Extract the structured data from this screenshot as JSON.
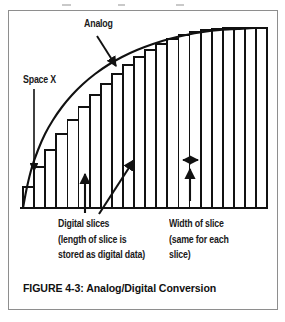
{
  "figure": {
    "caption": "FIGURE 4-3: Analog/Digital Conversion",
    "labels": {
      "analog": "Analog",
      "space_x": "Space X",
      "digital_slices": {
        "line1": "Digital slices",
        "line2": "(length of slice is",
        "line3": "stored as digital data)"
      },
      "width_of_slice": {
        "line1": "Width of slice",
        "line2": "(same for each",
        "line3": "slice)"
      }
    },
    "colors": {
      "ink": "#111111",
      "frame": "#8e8e8e",
      "paper": "#ffffff"
    }
  },
  "chart_data": {
    "type": "area",
    "title": "FIGURE 4-3: Analog/Digital Conversion",
    "xlabel": "",
    "ylabel": "",
    "grid": false,
    "legend": "none",
    "xlim": [
      0,
      270
    ],
    "ylim": [
      0,
      200
    ],
    "series": [
      {
        "name": "Analog",
        "type": "line",
        "note": "smooth concave-down analog waveform rising from the baseline and flattening at the right",
        "points": [
          [
            22,
            207
          ],
          [
            26,
            186
          ],
          [
            31,
            166
          ],
          [
            37,
            149
          ],
          [
            44,
            133
          ],
          [
            52,
            119
          ],
          [
            61,
            106
          ],
          [
            71,
            94
          ],
          [
            82,
            83
          ],
          [
            94,
            73
          ],
          [
            107,
            64
          ],
          [
            121,
            56
          ],
          [
            136,
            49
          ],
          [
            152,
            43
          ],
          [
            168,
            38
          ],
          [
            185,
            34
          ],
          [
            202,
            31
          ],
          [
            219,
            29
          ],
          [
            236,
            28
          ],
          [
            253,
            27
          ],
          [
            266,
            27
          ]
        ]
      },
      {
        "name": "Digital slices",
        "type": "bar",
        "note": "22 equal-width vertical slices; each slice top is flat and meets the analog curve at the slice right edge",
        "baseline_y": 207,
        "slice_count": 22,
        "slice_left_x": 22,
        "slice_width": 11.1,
        "top_y": [
          186,
          166,
          149,
          133,
          119,
          106,
          94,
          83,
          73,
          64,
          56,
          49,
          43,
          38,
          34,
          31,
          29,
          28,
          27,
          27,
          27,
          27
        ]
      }
    ],
    "annotations": [
      {
        "name": "analog-pointer",
        "text": "Analog",
        "from": [
          96,
          33
        ],
        "to": [
          115,
          64
        ],
        "arrow": "end"
      },
      {
        "name": "space-x-pointer",
        "text": "Space X",
        "from": [
          33,
          86
        ],
        "to": [
          33,
          172
        ],
        "arrow": "end"
      },
      {
        "name": "digital-slices-arrow-left",
        "text": "Digital slices",
        "from": [
          84,
          212
        ],
        "to": [
          84,
          172
        ],
        "arrow": "end"
      },
      {
        "name": "digital-slices-arrow-right",
        "text": "Digital slices",
        "from": [
          98,
          212
        ],
        "to": [
          133,
          158
        ],
        "arrow": "end"
      },
      {
        "name": "width-of-slice-arrow",
        "text": "Width of slice",
        "from": [
          189,
          198
        ],
        "to": [
          189,
          166
        ],
        "arrow": "end"
      },
      {
        "name": "slice-width-measure",
        "text": "Width of slice",
        "from": [
          181,
          158
        ],
        "to": [
          197,
          158
        ],
        "arrow": "both"
      }
    ]
  }
}
